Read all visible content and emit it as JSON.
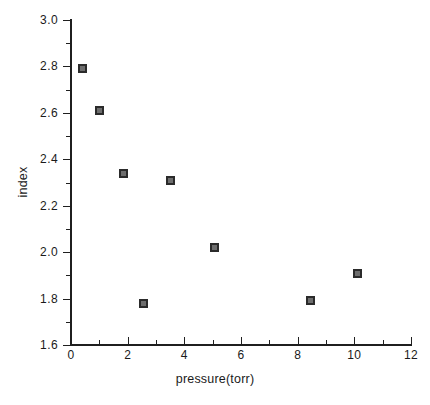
{
  "chart_data": {
    "type": "scatter",
    "title": "",
    "subtitle": "",
    "xlabel": "pressure(torr)",
    "ylabel": "index",
    "xlim": [
      0,
      12
    ],
    "ylim": [
      1.6,
      3.0
    ],
    "xticks": [
      0,
      2,
      4,
      6,
      8,
      10,
      12
    ],
    "xtick_labels": [
      "0",
      "2",
      "4",
      "6",
      "8",
      "10",
      "12"
    ],
    "xtick_minor_step": 1,
    "yticks": [
      1.6,
      1.8,
      2.0,
      2.2,
      2.4,
      2.6,
      2.8,
      3.0
    ],
    "ytick_labels": [
      "1.6",
      "1.8",
      "2.0",
      "2.2",
      "2.4",
      "2.6",
      "2.8",
      "3.0"
    ],
    "ytick_minor_step": 0.1,
    "grid": false,
    "legend": null,
    "marker": "open-square",
    "marker_color": "#2b2b2b",
    "background_color": "#ffffff",
    "axis_color": "#1f1f1f",
    "series": [
      {
        "name": "index vs pressure",
        "x": [
          0.4,
          1.0,
          1.85,
          2.55,
          3.5,
          5.05,
          8.45,
          10.1
        ],
        "y": [
          2.79,
          2.61,
          2.34,
          1.78,
          2.31,
          2.02,
          1.79,
          1.91
        ],
        "points": [
          {
            "x": 0.4,
            "y": 2.79
          },
          {
            "x": 1.0,
            "y": 2.61
          },
          {
            "x": 1.85,
            "y": 2.34
          },
          {
            "x": 2.55,
            "y": 1.78
          },
          {
            "x": 3.5,
            "y": 2.31
          },
          {
            "x": 5.05,
            "y": 2.02
          },
          {
            "x": 8.45,
            "y": 1.79
          },
          {
            "x": 10.1,
            "y": 1.91
          }
        ]
      }
    ]
  }
}
